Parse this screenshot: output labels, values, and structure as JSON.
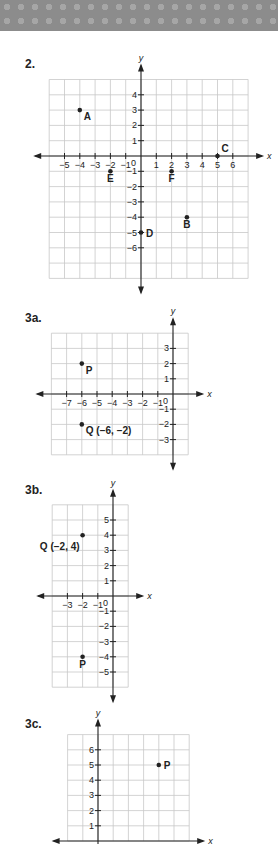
{
  "problems": [
    {
      "label": "2.",
      "graph": {
        "origin": [
          141,
          156
        ],
        "unit": 15.3,
        "xrange": [
          -6,
          7
        ],
        "yrange": [
          -8,
          5
        ],
        "x_ticks": [
          -5,
          -4,
          -3,
          -2,
          -1,
          1,
          2,
          3,
          4,
          5,
          6
        ],
        "y_ticks": [
          4,
          3,
          2,
          1,
          -1,
          -2,
          -3,
          -4,
          -5,
          -6
        ],
        "x_axis_label": "x",
        "y_axis_label": "y",
        "origin_label": "0",
        "points": [
          {
            "name": "A",
            "x": -4,
            "y": 3,
            "label": "A",
            "pos": "below-right"
          },
          {
            "name": "B",
            "x": 3,
            "y": -4,
            "label": "B",
            "pos": "below"
          },
          {
            "name": "C",
            "x": 5,
            "y": 0,
            "label": "C",
            "pos": "above-right"
          },
          {
            "name": "D",
            "x": 0,
            "y": -5,
            "label": "D",
            "pos": "right"
          },
          {
            "name": "E",
            "x": -2,
            "y": -1,
            "label": "E",
            "pos": "below"
          },
          {
            "name": "F",
            "x": 2,
            "y": -1,
            "label": "F",
            "pos": "below"
          }
        ]
      }
    },
    {
      "label": "3a.",
      "graph": {
        "origin": [
          173,
          394
        ],
        "unit": 15.2,
        "xrange": [
          -8,
          1
        ],
        "yrange": [
          -4,
          4
        ],
        "x_ticks": [
          -7,
          -6,
          -5,
          -4,
          -3,
          -2,
          -1
        ],
        "y_ticks": [
          3,
          2,
          1,
          -1,
          -2,
          -3
        ],
        "x_axis_label": "x",
        "y_axis_label": "y",
        "origin_label": "0",
        "points": [
          {
            "name": "P",
            "x": -6,
            "y": 2,
            "label": "P",
            "pos": "below-right"
          },
          {
            "name": "Q",
            "x": -6,
            "y": -2,
            "label": "Q (−6, −2)",
            "pos": "below-right"
          }
        ]
      }
    },
    {
      "label": "3b.",
      "graph": {
        "origin": [
          113,
          596
        ],
        "unit": 15.2,
        "xrange": [
          -4,
          1
        ],
        "yrange": [
          -6,
          6
        ],
        "x_ticks": [
          -3,
          -2,
          -1
        ],
        "y_ticks": [
          5,
          4,
          3,
          2,
          1,
          -1,
          -2,
          -3,
          -4,
          -5
        ],
        "x_axis_label": "x",
        "y_axis_label": "y",
        "origin_label": "0",
        "points": [
          {
            "name": "Q",
            "x": -2,
            "y": 4,
            "label": "Q (−2, 4)",
            "pos": "below-left"
          },
          {
            "name": "P",
            "x": -2,
            "y": -4,
            "label": "P",
            "pos": "below"
          }
        ]
      }
    },
    {
      "label": "3c.",
      "graph": {
        "origin": [
          98,
          841
        ],
        "unit": 15.2,
        "xrange": [
          -2,
          6
        ],
        "yrange": [
          0,
          7
        ],
        "x_ticks": [],
        "y_ticks": [
          6,
          5,
          4,
          3,
          2,
          1
        ],
        "x_axis_label": "x",
        "y_axis_label": "y",
        "origin_label": "",
        "points": [
          {
            "name": "P",
            "x": 4,
            "y": 5,
            "label": "P",
            "pos": "right"
          }
        ]
      }
    }
  ],
  "label_positions": [
    [
      25,
      57
    ],
    [
      25,
      311
    ],
    [
      25,
      483
    ],
    [
      25,
      717
    ]
  ],
  "colors": {
    "grid": "#c8c8c8",
    "axis": "#222222",
    "text": "#222222",
    "banner": "#8c8c8c"
  }
}
